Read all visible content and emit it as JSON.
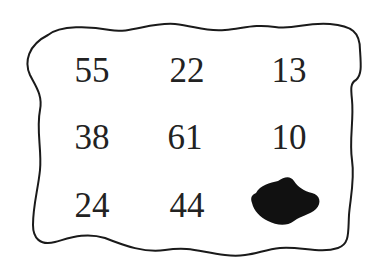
{
  "figure": {
    "type": "number-grid-with-hidden-cell",
    "rows": 3,
    "columns": 3,
    "cells": [
      {
        "row": 0,
        "col": 0,
        "value": "55",
        "x": 92,
        "y": 70
      },
      {
        "row": 0,
        "col": 1,
        "value": "22",
        "x": 187,
        "y": 70
      },
      {
        "row": 0,
        "col": 2,
        "value": "13",
        "x": 289,
        "y": 70
      },
      {
        "row": 1,
        "col": 0,
        "value": "38",
        "x": 92,
        "y": 137
      },
      {
        "row": 1,
        "col": 1,
        "value": "61",
        "x": 185,
        "y": 137
      },
      {
        "row": 1,
        "col": 2,
        "value": "10",
        "x": 289,
        "y": 137
      },
      {
        "row": 2,
        "col": 0,
        "value": "24",
        "x": 92,
        "y": 205
      },
      {
        "row": 2,
        "col": 1,
        "value": "44",
        "x": 187,
        "y": 205
      },
      {
        "row": 2,
        "col": 2,
        "value": null,
        "hidden": true,
        "cover": "ink-blot"
      }
    ],
    "colors": {
      "text": "#222222",
      "border": "#1a1a1a",
      "blot": "#111111",
      "background": "#ffffff"
    }
  }
}
